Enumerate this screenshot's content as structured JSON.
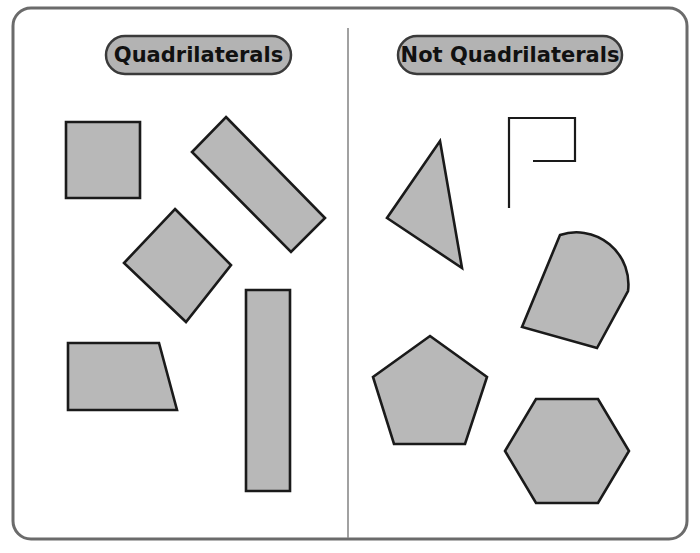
{
  "poster": {
    "name": "quadrilaterals-sorting-poster",
    "width": 700,
    "height": 553,
    "background_color": "#ffffff",
    "border": {
      "name": "outer-rounded-border",
      "color": "#6b6b6b",
      "stroke_width": 3,
      "corner_radius": 18,
      "x": 13,
      "y": 8,
      "w": 674,
      "h": 531
    },
    "divider": {
      "name": "vertical-divider",
      "color": "#8a8a8a",
      "stroke_width": 1.6,
      "x": 348,
      "y1": 28,
      "y2": 538
    }
  },
  "colors": {
    "shape_fill": "#b8b8b8",
    "shape_stroke": "#1a1a1a",
    "pill_fill": "#b3b3b3",
    "pill_stroke": "#3a3a3a",
    "label_text": "#111111",
    "border_gray": "#6b6b6b",
    "divider_gray": "#8a8a8a",
    "outline_only_stroke": "#1a1a1a"
  },
  "columns": [
    {
      "id": "quadrilaterals",
      "header": {
        "label": "Quadrilaterals",
        "pill": {
          "x": 106,
          "y": 36,
          "w": 185,
          "h": 38,
          "rx": 19
        },
        "font_size": 21
      },
      "shape_count": 5,
      "shapes": [
        {
          "name": "shape-square",
          "kind": "square",
          "filled": true,
          "points": "66,122 140,122 140,198 66,198"
        },
        {
          "name": "shape-rotated-rectangle",
          "kind": "rectangle-rotated",
          "filled": true,
          "points": "226,117 325,218 291,252 192,152"
        },
        {
          "name": "shape-rotated-square-diamond",
          "kind": "square-rotated",
          "filled": true,
          "points": "175,209 231,265 186,322 124,263"
        },
        {
          "name": "shape-trapezoid",
          "kind": "trapezoid",
          "filled": true,
          "points": "68,343 159,343 177,410 68,410"
        },
        {
          "name": "shape-tall-rectangle",
          "kind": "rectangle-tall",
          "filled": true,
          "points": "246,290 290,290 290,491 246,491"
        }
      ]
    },
    {
      "id": "not-quadrilaterals",
      "header": {
        "label": "Not Quadrilaterals",
        "pill": {
          "x": 398,
          "y": 36,
          "w": 224,
          "h": 38,
          "rx": 19
        },
        "font_size": 21
      },
      "shape_count": 5,
      "shapes": [
        {
          "name": "shape-triangle",
          "kind": "triangle",
          "filled": true,
          "points": "440,141 462,268 387,218"
        },
        {
          "name": "shape-open-polyline",
          "kind": "open-path",
          "filled": false,
          "path": "M 509,208 L 509,118 L 575,118 L 575,161 L 533,161"
        },
        {
          "name": "shape-dome-arch",
          "kind": "dome",
          "filled": true,
          "path": "M 522,327 L 560,235 A 52 52 0 0 1 628,291 L 597,348 Z"
        },
        {
          "name": "shape-pentagon",
          "kind": "pentagon",
          "filled": true,
          "points": "430,336 487,377 465,444 394,444 373,377"
        },
        {
          "name": "shape-hexagon",
          "kind": "hexagon",
          "filled": true,
          "points": "536,399 598,399 629,451 598,503 536,503 505,451"
        }
      ]
    }
  ]
}
